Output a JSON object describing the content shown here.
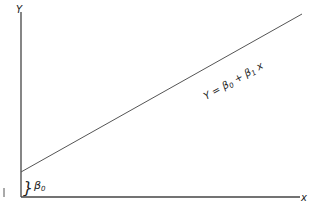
{
  "diagram": {
    "y_axis_label": "Y",
    "x_axis_label": "x",
    "line_label_prefix": "Y = ",
    "beta0": "β",
    "beta0_sub": "0",
    "plus": " + ",
    "beta1": "β",
    "beta1_sub": "1",
    "x_var": " x",
    "intercept_label": "β",
    "intercept_sub": "0",
    "brace": "}",
    "left_mark": "|",
    "line_color": "#555555",
    "axis_color": "#333333"
  }
}
